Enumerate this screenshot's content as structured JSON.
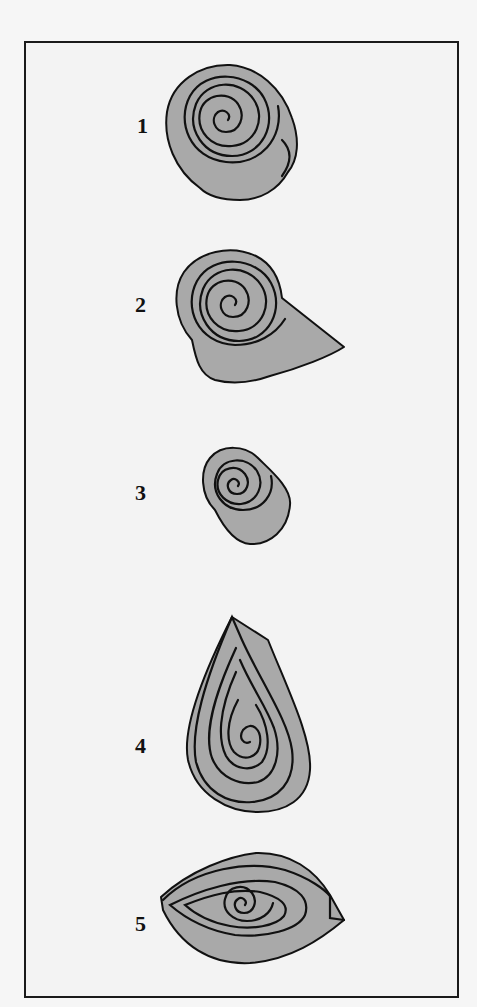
{
  "figure": {
    "title": "",
    "colors": {
      "shape_fill": "#a9a9a9",
      "outline": "#111111",
      "background": "#f3f3f3"
    },
    "items": [
      {
        "number": "1",
        "shape": "tight coil (rolled)"
      },
      {
        "number": "2",
        "shape": "coil with loose tail"
      },
      {
        "number": "3",
        "shape": "small tight coil"
      },
      {
        "number": "4",
        "shape": "teardrop"
      },
      {
        "number": "5",
        "shape": "eye / marquise"
      }
    ]
  }
}
